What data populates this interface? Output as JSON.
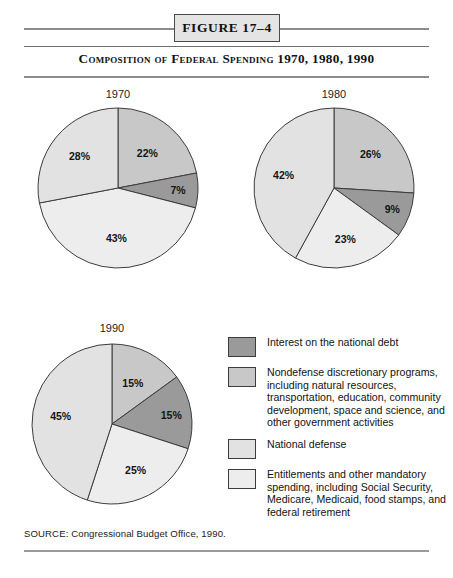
{
  "figure": {
    "badge_label": "FIGURE 17–4",
    "subtitle": "Composition of Federal Spending 1970, 1980, 1990",
    "source": "SOURCE: Congressional Budget Office, 1990."
  },
  "colors": {
    "interest": "#9a9a9a",
    "nondefense": "#c8c8c8",
    "national_defense": "#e2e2e2",
    "entitlements": "#ededed",
    "outline": "#3c3c3c",
    "rule": "#8b8b8b",
    "badge_fill": "#e4e4e4"
  },
  "legend": {
    "items": [
      {
        "key": "interest",
        "swatch_color": "#9a9a9a",
        "label": "Interest on the national debt"
      },
      {
        "key": "nondefense",
        "swatch_color": "#c8c8c8",
        "label": "Nondefense discretionary programs, including natural resources, transportation, education, community development, space and science, and other government activities"
      },
      {
        "key": "national_defense",
        "swatch_color": "#e2e2e2",
        "label": "National defense"
      },
      {
        "key": "entitlements",
        "swatch_color": "#ededed",
        "label": "Entitlements and other mandatory spending, including Social Security, Medicare, Medicaid, food stamps, and federal retirement"
      }
    ]
  },
  "chart_data": [
    {
      "type": "pie",
      "title": "1970",
      "categories": [
        "Nondefense discretionary programs",
        "Interest on the national debt",
        "Entitlements and other mandatory spending",
        "National defense"
      ],
      "values": [
        22,
        7,
        43,
        28
      ],
      "labels": [
        "22%",
        "7%",
        "43%",
        "28%"
      ],
      "colors": [
        "#c8c8c8",
        "#9a9a9a",
        "#ededed",
        "#e2e2e2"
      ],
      "start_angle_deg": 0,
      "direction": "clockwise",
      "units": "percent of federal spending"
    },
    {
      "type": "pie",
      "title": "1980",
      "categories": [
        "Nondefense discretionary programs",
        "Interest on the national debt",
        "Entitlements and other mandatory spending",
        "National defense"
      ],
      "values": [
        26,
        9,
        23,
        42
      ],
      "labels": [
        "26%",
        "9%",
        "23%",
        "42%"
      ],
      "colors": [
        "#c8c8c8",
        "#9a9a9a",
        "#ededed",
        "#e2e2e2"
      ],
      "start_angle_deg": 0,
      "direction": "clockwise",
      "units": "percent of federal spending"
    },
    {
      "type": "pie",
      "title": "1990",
      "categories": [
        "Nondefense discretionary programs",
        "Interest on the national debt",
        "Entitlements and other mandatory spending",
        "National defense"
      ],
      "values": [
        15,
        15,
        25,
        45
      ],
      "labels": [
        "15%",
        "15%",
        "25%",
        "45%"
      ],
      "colors": [
        "#c8c8c8",
        "#9a9a9a",
        "#ededed",
        "#e2e2e2"
      ],
      "start_angle_deg": 0,
      "direction": "clockwise",
      "units": "percent of federal spending"
    }
  ]
}
